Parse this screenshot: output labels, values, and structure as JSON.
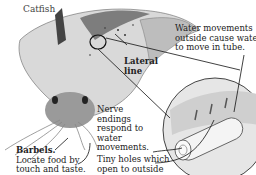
{
  "diagram": {
    "title": "Catfish",
    "labels": {
      "water_movements": [
        "Water movements",
        "outside cause water",
        "to move in tube."
      ],
      "lateral_line": [
        "Lateral",
        "line"
      ],
      "nerve_endings": [
        "Nerve",
        "endings",
        "respond to",
        "water",
        "movements."
      ],
      "tiny_holes": [
        "Tiny holes which",
        "open to outside"
      ],
      "barbels_title": "Barbels.",
      "barbels_desc": [
        "Locate food by",
        "touch and taste."
      ]
    },
    "colors": {
      "ink": "#222222",
      "shade": "#8a8a8a",
      "light": "#d9d9d9",
      "background": "#ffffff"
    }
  }
}
